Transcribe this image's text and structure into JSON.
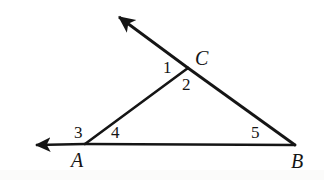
{
  "figure": {
    "type": "geometry-diagram",
    "background_color": "#ffffff",
    "stroke_color": "#151515",
    "canvas": {
      "width": 324,
      "height": 180
    }
  },
  "vertices": [
    {
      "id": "A",
      "label": "A",
      "x": 85,
      "y": 144,
      "label_x": 71,
      "label_y": 150
    },
    {
      "id": "B",
      "label": "B",
      "x": 295,
      "y": 145,
      "label_x": 291,
      "label_y": 151
    },
    {
      "id": "C",
      "label": "C",
      "x": 188,
      "y": 68,
      "label_x": 195,
      "label_y": 48
    }
  ],
  "segments": [
    {
      "id": "AB",
      "from": "A",
      "to": "B",
      "x1": 85,
      "y1": 144,
      "x2": 295,
      "y2": 145,
      "width": 2.6
    },
    {
      "id": "AC",
      "from": "A",
      "to": "C",
      "x1": 85,
      "y1": 144,
      "x2": 188,
      "y2": 68,
      "width": 2.6
    },
    {
      "id": "CB",
      "from": "C",
      "to": "B",
      "x1": 188,
      "y1": 68,
      "x2": 295,
      "y2": 145,
      "width": 2.8
    }
  ],
  "rays": [
    {
      "id": "ray-C-beyond",
      "description": "extension of line BC beyond C, arrow pointing up-left",
      "x1": 188,
      "y1": 68,
      "x2": 117,
      "y2": 16,
      "tip_x": 113,
      "tip_y": 11,
      "width": 2.8,
      "arrow": "triangle"
    },
    {
      "id": "ray-A-beyond",
      "description": "extension of line BA beyond A, arrow pointing left",
      "x1": 85,
      "y1": 144,
      "x2": 34,
      "y2": 145,
      "tip_x": 25,
      "tip_y": 145,
      "width": 2.6,
      "arrow": "triangle"
    }
  ],
  "angle_labels": [
    {
      "id": "angle-1",
      "label": "1",
      "x": 163,
      "y": 59,
      "at_vertex": "C",
      "kind": "exterior"
    },
    {
      "id": "angle-2",
      "label": "2",
      "x": 182,
      "y": 76,
      "at_vertex": "C",
      "kind": "interior"
    },
    {
      "id": "angle-3",
      "label": "3",
      "x": 74,
      "y": 124,
      "at_vertex": "A",
      "kind": "exterior"
    },
    {
      "id": "angle-4",
      "label": "4",
      "x": 111,
      "y": 124,
      "at_vertex": "A",
      "kind": "interior"
    },
    {
      "id": "angle-5",
      "label": "5",
      "x": 251,
      "y": 124,
      "at_vertex": "B",
      "kind": "interior"
    }
  ]
}
